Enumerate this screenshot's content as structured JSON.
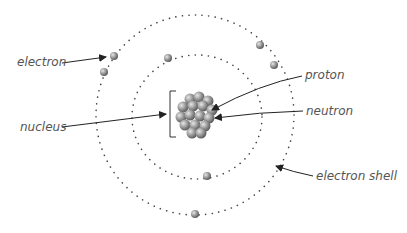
{
  "diagram": {
    "labels": {
      "electron": "electron",
      "nucleus": "nucleus",
      "proton": "proton",
      "neutron": "neutron",
      "electron_shell": "electron shell"
    },
    "colors": {
      "particle": "#8f8f8f",
      "shell_dots": "#444444",
      "arrow": "#222222",
      "label": "#555555"
    }
  }
}
